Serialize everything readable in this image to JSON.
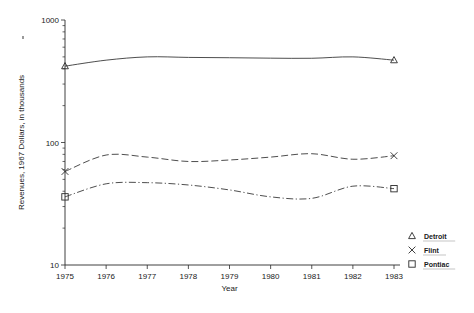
{
  "chart_data": {
    "type": "line",
    "title": "",
    "xlabel": "Year",
    "ylabel": "Revenues, 1967 Dollars, in thousands",
    "yscale": "log",
    "ylim": [
      10,
      1000
    ],
    "ytick_labels": [
      "1000",
      "100",
      "10"
    ],
    "ytick_values": [
      1000,
      100,
      10
    ],
    "grid": false,
    "legend_position": "right",
    "categories": [
      1975,
      1976,
      1977,
      1978,
      1979,
      1980,
      1981,
      1982,
      1983
    ],
    "xtick_labels": [
      "1975",
      "1976",
      "1977",
      "1978",
      "1979",
      "1980",
      "1981",
      "1982",
      "1983"
    ],
    "series": [
      {
        "name": "Detroit",
        "marker": "triangle",
        "linestyle": "solid",
        "values": [
          420,
          470,
          500,
          495,
          492,
          488,
          487,
          500,
          470
        ]
      },
      {
        "name": "Flint",
        "marker": "cross",
        "linestyle": "dashed",
        "values": [
          58,
          79,
          76,
          70,
          72,
          76,
          81,
          73,
          78
        ]
      },
      {
        "name": "Pontiac",
        "marker": "square",
        "linestyle": "dashdot",
        "values": [
          36,
          46,
          47,
          45,
          41,
          36,
          35,
          44,
          42
        ]
      }
    ]
  },
  "legend": {
    "items": [
      {
        "label": "Detroit",
        "marker": "triangle"
      },
      {
        "label": "Flint",
        "marker": "cross"
      },
      {
        "label": "Pontiac",
        "marker": "square"
      }
    ]
  },
  "colors": {
    "ink": "#2b2b2b",
    "line": "#3a3a3a",
    "background": "#ffffff"
  }
}
